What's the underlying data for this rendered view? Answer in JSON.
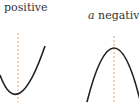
{
  "panels": [
    {
      "var": "a",
      "text": "positive",
      "shape": "upward parabola"
    },
    {
      "var": "a",
      "text": "negative",
      "shape": "downward parabola"
    }
  ],
  "colors": {
    "curve": "#222222",
    "axis": "#e8a070"
  }
}
